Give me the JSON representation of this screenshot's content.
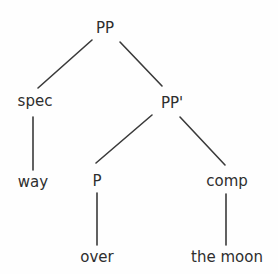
{
  "figure": {
    "name": "syntax-tree-pp",
    "background_color": "#fefefe",
    "edge_color": "#3a3a3a",
    "text_color": "#2e2e2e",
    "width": 278,
    "height": 274,
    "clipped_top_caption": ""
  },
  "nodes": [
    {
      "id": "root",
      "label": "PP",
      "x": 105,
      "y": 28,
      "kind": "phrase"
    },
    {
      "id": "spec",
      "label": "spec",
      "x": 35,
      "y": 101,
      "kind": "position"
    },
    {
      "id": "pp-bar",
      "label": "PP'",
      "x": 172,
      "y": 103,
      "kind": "phrase"
    },
    {
      "id": "way",
      "label": "way",
      "x": 33,
      "y": 182,
      "kind": "terminal"
    },
    {
      "id": "p-head",
      "label": "P",
      "x": 97,
      "y": 181,
      "kind": "head"
    },
    {
      "id": "comp",
      "label": "comp",
      "x": 227,
      "y": 181,
      "kind": "position"
    },
    {
      "id": "over",
      "label": "over",
      "x": 97,
      "y": 257,
      "kind": "terminal"
    },
    {
      "id": "the-moon",
      "label": "the moon",
      "x": 227,
      "y": 257,
      "kind": "terminal"
    }
  ],
  "edges": [
    {
      "id": "root-spec",
      "from": "root",
      "to": "spec",
      "x1": 92,
      "y1": 40,
      "x2": 38,
      "y2": 88,
      "type": "diagonal"
    },
    {
      "id": "root-ppbar",
      "from": "root",
      "to": "pp-bar",
      "x1": 120,
      "y1": 42,
      "x2": 162,
      "y2": 86,
      "type": "diagonal"
    },
    {
      "id": "spec-way",
      "from": "spec",
      "to": "way",
      "x1": 33,
      "y1": 117,
      "x2": 33,
      "y2": 170,
      "type": "vertical"
    },
    {
      "id": "ppbar-p",
      "from": "pp-bar",
      "to": "p-head",
      "x1": 152,
      "y1": 115,
      "x2": 96,
      "y2": 163,
      "type": "diagonal"
    },
    {
      "id": "ppbar-comp",
      "from": "pp-bar",
      "to": "comp",
      "x1": 180,
      "y1": 117,
      "x2": 225,
      "y2": 165,
      "type": "diagonal"
    },
    {
      "id": "p-over",
      "from": "p-head",
      "to": "over",
      "x1": 97,
      "y1": 193,
      "x2": 97,
      "y2": 245,
      "type": "vertical"
    },
    {
      "id": "comp-themoon",
      "from": "comp",
      "to": "the-moon",
      "x1": 226,
      "y1": 194,
      "x2": 226,
      "y2": 245,
      "type": "vertical"
    }
  ]
}
